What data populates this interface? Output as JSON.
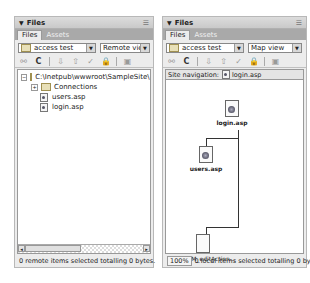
{
  "left_panel": {
    "title": "Files",
    "options_icon": "panel-options-icon",
    "tabs": [
      {
        "label": "Files",
        "active": true
      },
      {
        "label": "Assets",
        "active": false
      }
    ],
    "site_select": "access test",
    "view_select": "Remote view",
    "toolbar": [
      "connect-icon",
      "refresh-icon",
      "get-icon",
      "put-icon",
      "checkout-icon",
      "checkin-icon",
      "expand-icon"
    ],
    "tree": [
      {
        "label": "C:\\Inetpub\\wwwroot\\SampleSite\\",
        "type": "folder",
        "level": 0,
        "expander": "−"
      },
      {
        "label": "Connections",
        "type": "folder",
        "level": 1,
        "expander": "+"
      },
      {
        "label": "users.asp",
        "type": "file",
        "level": 1
      },
      {
        "label": "login.asp",
        "type": "file",
        "level": 1
      }
    ],
    "status": "0 remote items selected totalling 0 bytes."
  },
  "right_panel": {
    "title": "Files",
    "options_icon": "panel-options-icon",
    "tabs": [
      {
        "label": "Files",
        "active": true
      },
      {
        "label": "Assets",
        "active": false
      }
    ],
    "site_select": "access test",
    "view_select": "Map view",
    "toolbar": [
      "connect-icon",
      "refresh-icon",
      "get-icon",
      "put-icon",
      "checkout-icon",
      "checkin-icon",
      "expand-icon"
    ],
    "site_navigation_label": "Site navigation:",
    "site_navigation_file": "login.asp",
    "map_nodes": [
      {
        "label": "login.asp"
      },
      {
        "label": "users.asp"
      },
      {
        "label": "<%=MM_editAction..."
      }
    ],
    "zoom": "100%",
    "status": "0 local items selected totalling 0 bytes."
  }
}
